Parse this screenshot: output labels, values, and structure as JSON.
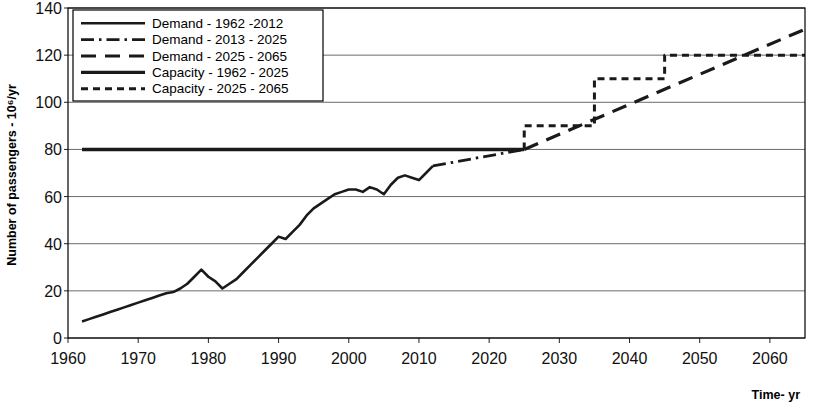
{
  "chart_data": {
    "type": "line",
    "title": "",
    "xlabel": "Time- yr",
    "ylabel": "Number of passengers - 10⁶/yr",
    "xlim": [
      1960,
      2065
    ],
    "ylim": [
      0,
      140
    ],
    "xticks": [
      1960,
      1970,
      1980,
      1990,
      2000,
      2010,
      2020,
      2030,
      2040,
      2050,
      2060
    ],
    "yticks": [
      0,
      20,
      40,
      60,
      80,
      100,
      120,
      140
    ],
    "grid": "horizontal",
    "legend_position": "top-left",
    "series": [
      {
        "name": "Demand - 1962 -2012",
        "style": "solid",
        "x": [
          1962,
          1963,
          1964,
          1965,
          1966,
          1967,
          1968,
          1969,
          1970,
          1971,
          1972,
          1973,
          1974,
          1975,
          1976,
          1977,
          1978,
          1979,
          1980,
          1981,
          1982,
          1983,
          1984,
          1985,
          1986,
          1987,
          1988,
          1989,
          1990,
          1991,
          1992,
          1993,
          1994,
          1995,
          1996,
          1997,
          1998,
          1999,
          2000,
          2001,
          2002,
          2003,
          2004,
          2005,
          2006,
          2007,
          2008,
          2009,
          2010,
          2011,
          2012
        ],
        "values": [
          7,
          8,
          9,
          10,
          11,
          12,
          13,
          14,
          15,
          16,
          17,
          18,
          19,
          19.5,
          21,
          23,
          26,
          29,
          26,
          24,
          21,
          23,
          25,
          28,
          31,
          34,
          37,
          40,
          43,
          42,
          45,
          48,
          52,
          55,
          57,
          59,
          61,
          62,
          63,
          63,
          62,
          64,
          63,
          61,
          65,
          68,
          69,
          68,
          67,
          70,
          73
        ]
      },
      {
        "name": "Demand - 2013 - 2025",
        "style": "dash-dot",
        "x": [
          2012,
          2025
        ],
        "values": [
          73,
          80
        ]
      },
      {
        "name": "Demand - 2025 - 2065",
        "style": "long-dash",
        "x": [
          2025,
          2065
        ],
        "values": [
          80,
          131
        ]
      },
      {
        "name": "Capacity - 1962 -  2025",
        "style": "solid-thick",
        "x": [
          1962,
          2025
        ],
        "values": [
          80,
          80
        ]
      },
      {
        "name": "Capacity - 2025 - 2065",
        "style": "short-dash",
        "steps": [
          {
            "from": 2025,
            "to": 2035,
            "value": 90
          },
          {
            "from": 2035,
            "to": 2045,
            "value": 110
          },
          {
            "from": 2045,
            "to": 2065,
            "value": 120
          }
        ]
      }
    ],
    "annotations": []
  },
  "legend": {
    "entries": [
      {
        "label": "Demand - 1962 -2012",
        "style": "solid"
      },
      {
        "label": "Demand - 2013 - 2025",
        "style": "dash-dot"
      },
      {
        "label": "Demand - 2025 - 2065",
        "style": "long-dash"
      },
      {
        "label": "Capacity - 1962 -  2025",
        "style": "solid-thick"
      },
      {
        "label": "Capacity - 2025 - 2065",
        "style": "short-dash"
      }
    ]
  },
  "axes": {
    "y_title": "Number of passengers - 10⁶/yr",
    "x_title": "Time- yr",
    "y_tick_labels": [
      "140",
      "120",
      "100",
      "80",
      "60",
      "40",
      "20",
      "0"
    ],
    "x_tick_labels": [
      "1960",
      "1970",
      "1980",
      "1990",
      "2000",
      "2010",
      "2020",
      "2030",
      "2040",
      "2050",
      "2060"
    ]
  }
}
